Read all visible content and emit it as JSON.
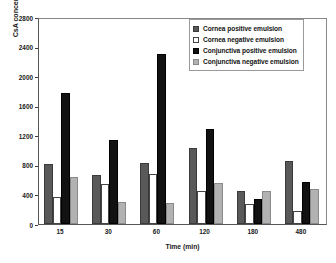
{
  "chart_data": {
    "type": "bar",
    "title": "",
    "xlabel": "Time (min)",
    "ylabel": "CsA concentration, ng/g",
    "categories": [
      "15",
      "30",
      "60",
      "120",
      "180",
      "480"
    ],
    "ylim": [
      0,
      2800
    ],
    "yticks": [
      0,
      400,
      800,
      1200,
      1600,
      2000,
      2400,
      2800
    ],
    "ytick_labels": [
      "0",
      "400",
      "800",
      "1200",
      "1600",
      "2000",
      "2400",
      "2800"
    ],
    "grid": false,
    "legend_position": "top-right",
    "series": [
      {
        "name": "Cornea positive emulsion",
        "color": "#595959",
        "values": [
          810,
          660,
          830,
          1030,
          440,
          855
        ]
      },
      {
        "name": "Cornea negative emulsion",
        "color": "#ffffff",
        "values": [
          360,
          540,
          680,
          440,
          265,
          170
        ]
      },
      {
        "name": "Conjunctiva positive emulsion",
        "color": "#121212",
        "values": [
          1775,
          1140,
          2300,
          1290,
          345,
          570
        ]
      },
      {
        "name": "Conjunctiva negative emulsion",
        "color": "#b2b2b2",
        "values": [
          640,
          300,
          290,
          560,
          440,
          470
        ]
      }
    ]
  }
}
